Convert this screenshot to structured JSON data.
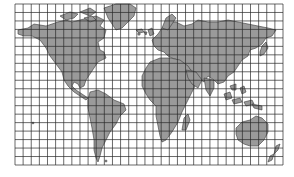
{
  "map": {
    "type": "world-map-with-grid",
    "colors": {
      "background": "#ffffff",
      "land": "#9a9a9a",
      "grid": "#2a2a2a",
      "coast": "#3a3a3a"
    },
    "grid": {
      "x0": 15,
      "y0": 4,
      "x1": 283,
      "y1": 165,
      "cols": 33,
      "rows": 19
    },
    "continents": [
      {
        "name": "north-america"
      },
      {
        "name": "greenland"
      },
      {
        "name": "south-america"
      },
      {
        "name": "europe-asia"
      },
      {
        "name": "africa"
      },
      {
        "name": "madagascar"
      },
      {
        "name": "australia"
      },
      {
        "name": "new-zealand"
      },
      {
        "name": "japan"
      },
      {
        "name": "indonesia"
      },
      {
        "name": "british-isles"
      },
      {
        "name": "iceland"
      }
    ]
  }
}
